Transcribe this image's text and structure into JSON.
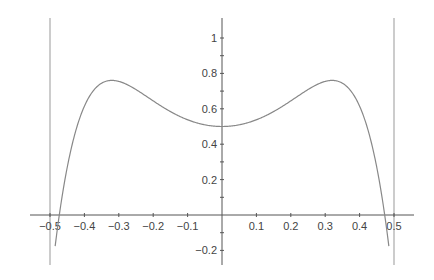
{
  "chart_data": {
    "type": "line",
    "title": "",
    "xlabel": "",
    "ylabel": "",
    "xlim": [
      -0.57,
      0.57
    ],
    "ylim": [
      -0.28,
      1.1
    ],
    "grid": false,
    "x_ticks": [
      -0.5,
      -0.4,
      -0.3,
      -0.2,
      -0.1,
      0.1,
      0.2,
      0.3,
      0.4,
      0.5
    ],
    "x_tick_labels": [
      "−0.5",
      "−0.4",
      "−0.3",
      "−0.2",
      "−0.1",
      "0.1",
      "0.2",
      "0.3",
      "0.4",
      "0.5"
    ],
    "y_ticks": [
      -0.2,
      0.2,
      0.4,
      0.6,
      0.8,
      1
    ],
    "y_tick_labels": [
      "−0.2",
      "0.2",
      "0.4",
      "0.6",
      "0.8",
      "1"
    ],
    "vertical_lines": [
      -0.5,
      0.5
    ],
    "series": [
      {
        "name": "f(x)",
        "color": "#888888",
        "x": [
          -0.48,
          -0.47,
          -0.45,
          -0.42,
          -0.4,
          -0.35,
          -0.32,
          -0.3,
          -0.25,
          -0.2,
          -0.15,
          -0.1,
          -0.05,
          0,
          0.05,
          0.1,
          0.15,
          0.2,
          0.25,
          0.3,
          0.32,
          0.35,
          0.4,
          0.42,
          0.45,
          0.47,
          0.48
        ],
        "y": [
          -0.28,
          -0.05,
          0.25,
          0.55,
          0.66,
          0.75,
          0.76,
          0.75,
          0.71,
          0.65,
          0.58,
          0.54,
          0.51,
          0.5,
          0.51,
          0.54,
          0.58,
          0.65,
          0.71,
          0.75,
          0.76,
          0.75,
          0.66,
          0.55,
          0.25,
          -0.05,
          -0.28
        ]
      }
    ],
    "key_points": {
      "y_intercept": 0.5,
      "local_maxima": [
        [
          -0.32,
          0.76
        ],
        [
          0.32,
          0.76
        ]
      ],
      "roots": [
        -0.47,
        0.47
      ]
    }
  },
  "colors": {
    "axis": "#555555",
    "curve": "#888888",
    "guide_lines": "#999999",
    "tick_label": "#444444"
  }
}
